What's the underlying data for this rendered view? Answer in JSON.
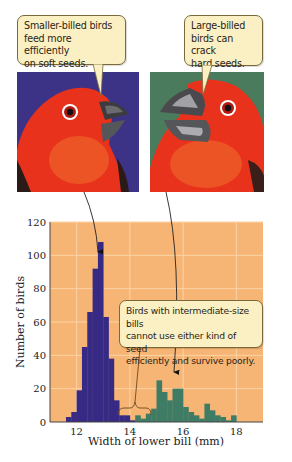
{
  "callouts": {
    "small_billed": [
      "Smaller-billed birds",
      "feed more efficiently",
      "on soft seeds."
    ],
    "large_billed": [
      "Large-billed",
      "birds can crack",
      "hard seeds."
    ],
    "intermediate": [
      "Birds with intermediate-size bills",
      "cannot use either kind of seed",
      "efficiently and survive poorly."
    ]
  },
  "panels": {
    "left": {
      "label": "small-billed-bird",
      "bg": "#3d3386"
    },
    "right": {
      "label": "large-billed-bird",
      "bg": "#4b7b5d"
    }
  },
  "colors": {
    "plot_bg": "#f6b574",
    "grid": "#fbd4a8",
    "small_bars": "#362a85",
    "large_bars": "#3f7c66",
    "bird_red": "#e8321c",
    "beak": "#4a4a4e"
  },
  "chart_data": {
    "type": "bar",
    "title": "",
    "xlabel": "Width of lower bill (mm)",
    "ylabel": "Number of birds",
    "xlim": [
      11,
      19
    ],
    "ylim": [
      0,
      120
    ],
    "xticks": [
      12,
      14,
      16,
      18
    ],
    "yticks": [
      0,
      20,
      40,
      60,
      80,
      100,
      120
    ],
    "grid": true,
    "bin_width": 0.2,
    "series": [
      {
        "name": "Small-billed birds",
        "color": "#362a85",
        "x": [
          11.6,
          11.8,
          12.0,
          12.2,
          12.4,
          12.6,
          12.8,
          13.0,
          13.2,
          13.4,
          13.6,
          13.8,
          14.0
        ],
        "values": [
          3,
          6,
          19,
          45,
          66,
          92,
          108,
          63,
          38,
          13,
          4,
          4,
          1
        ]
      },
      {
        "name": "Large-billed birds",
        "color": "#3f7c66",
        "x": [
          14.2,
          14.4,
          14.6,
          14.8,
          15.0,
          15.2,
          15.4,
          15.6,
          15.8,
          16.0,
          16.2,
          16.4,
          16.6,
          16.8,
          17.0,
          17.2,
          17.4,
          17.6,
          17.8
        ],
        "values": [
          4,
          2,
          5,
          8,
          25,
          18,
          13,
          20,
          20,
          9,
          6,
          4,
          2,
          11,
          7,
          4,
          3,
          1,
          4
        ]
      }
    ],
    "annotations": [
      "Smaller-billed birds feed more efficiently on soft seeds.",
      "Large-billed birds can crack hard seeds.",
      "Birds with intermediate-size bills cannot use either kind of seed efficiently and survive poorly."
    ]
  }
}
